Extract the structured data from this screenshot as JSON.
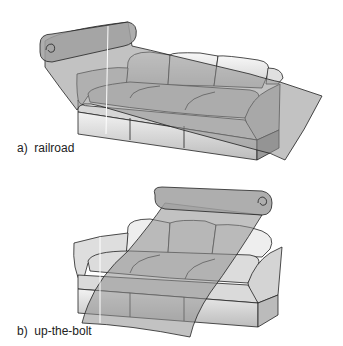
{
  "figure": {
    "panels": [
      {
        "id": "a",
        "caption": "a)  railroad",
        "method": "railroad"
      },
      {
        "id": "b",
        "caption": "b)  up-the-bolt",
        "method": "up-the-bolt"
      }
    ]
  },
  "colors": {
    "fabric": "#8f8f8f",
    "sofa_light": "#e8e8e8",
    "sofa_mid": "#bdbdbd",
    "outline": "#222222",
    "background": "#ffffff"
  }
}
